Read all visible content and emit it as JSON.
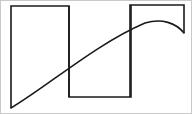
{
  "figure": {
    "title": "",
    "background_color": "#ffffff",
    "frame_color": "#c9c9c9",
    "stroke_color": "#1a1a1a",
    "width": 192,
    "height": 114,
    "description": "Line drawing: three open rectangular outlines forming a stepped bar silhouette with a smooth arc sweeping across them"
  },
  "chart_data": {
    "type": "line",
    "title": "",
    "xlabel": "",
    "ylabel": "",
    "xlim": [
      0,
      192
    ],
    "ylim": [
      114,
      0
    ],
    "grid": false,
    "legend": "none",
    "series": [
      {
        "name": "bar-outline-1",
        "kind": "polyline",
        "closed": false,
        "points": [
          [
            11,
            108
          ],
          [
            11,
            6
          ],
          [
            69,
            6
          ],
          [
            69,
            97
          ]
        ]
      },
      {
        "name": "bar-outline-2",
        "kind": "polyline",
        "closed": false,
        "points": [
          [
            69,
            6
          ],
          [
            69,
            97
          ],
          [
            131,
            97
          ],
          [
            131,
            5
          ]
        ]
      },
      {
        "name": "bar-outline-3",
        "kind": "polyline",
        "closed": false,
        "points": [
          [
            130,
            97
          ],
          [
            130,
            5
          ],
          [
            184,
            5
          ],
          [
            184,
            33
          ]
        ]
      },
      {
        "name": "arc-curve",
        "kind": "curve",
        "closed": false,
        "path": "M 11 108 C 48 86 96 44 145 23 C 162 18 176 23 184 33",
        "points": [
          [
            11,
            108
          ],
          [
            20,
            97
          ],
          [
            40,
            75
          ],
          [
            60,
            58
          ],
          [
            80,
            45
          ],
          [
            100,
            35
          ],
          [
            120,
            28
          ],
          [
            145,
            23
          ],
          [
            165,
            24
          ],
          [
            184,
            33
          ]
        ]
      }
    ],
    "annotations": []
  },
  "shapes": {
    "rect1": {
      "name": "left-open-bottom-rectangle",
      "x": 11,
      "y": 6,
      "w": 58,
      "h": 102
    },
    "rect2": {
      "name": "middle-open-top-rectangle",
      "x": 69,
      "y": 5,
      "w": 62,
      "h": 92
    },
    "rect3": {
      "name": "right-open-bottom-rectangle",
      "x": 130,
      "y": 5,
      "w": 54,
      "h": 28
    }
  },
  "stroke": {
    "outline_width": 1.6,
    "curve_width": 1.6
  }
}
